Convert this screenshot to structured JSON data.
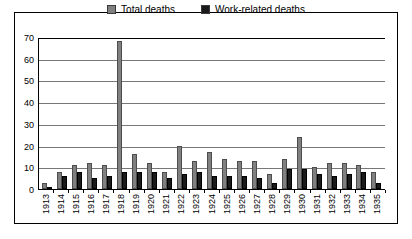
{
  "chart_data": {
    "type": "bar",
    "title": "",
    "xlabel": "",
    "ylabel": "",
    "ylim": [
      0,
      70
    ],
    "ytick_step": 10,
    "yticks": [
      70,
      60,
      50,
      40,
      30,
      20,
      10,
      0
    ],
    "grid": true,
    "legend_position": "top-center",
    "categories": [
      "1913",
      "1914",
      "1915",
      "1916",
      "1917",
      "1918",
      "1919",
      "1920",
      "1921",
      "1922",
      "1923",
      "1924",
      "1925",
      "1926",
      "1927",
      "1928",
      "1929",
      "1930",
      "1931",
      "1932",
      "1933",
      "1934",
      "1935"
    ],
    "series": [
      {
        "name": "Total deaths",
        "color": "#808080",
        "values": [
          3,
          8,
          11,
          12,
          11,
          68,
          16,
          12,
          8,
          20,
          13,
          17,
          14,
          13,
          13,
          7,
          14,
          24,
          10,
          12,
          12,
          11,
          8
        ]
      },
      {
        "name": "Work-related deaths",
        "color": "#1a1a1a",
        "values": [
          1,
          6,
          8,
          5,
          6,
          8,
          8,
          8,
          5,
          7,
          8,
          6,
          6,
          6,
          5,
          3,
          9,
          9,
          7,
          6,
          7,
          8,
          3
        ]
      }
    ]
  },
  "legend": {
    "items": [
      {
        "label": "Total deaths",
        "swatch": "total-deaths-swatch"
      },
      {
        "label": "Work-related deaths",
        "swatch": "work-related-deaths-swatch"
      }
    ]
  }
}
